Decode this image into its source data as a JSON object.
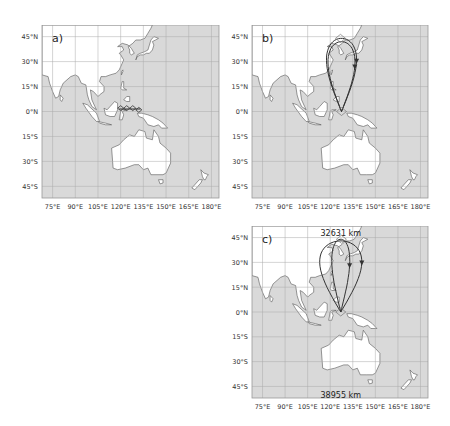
{
  "figure": {
    "panels": [
      {
        "id": "a",
        "label": "a)",
        "left": 42,
        "top": 25,
        "width": 177,
        "height": 173,
        "track": "none",
        "annotations": []
      },
      {
        "id": "b",
        "label": "b)",
        "left": 252,
        "top": 25,
        "width": 176,
        "height": 173,
        "track": "figure-eight",
        "annotations": []
      },
      {
        "id": "c",
        "label": "c)",
        "left": 252,
        "top": 226,
        "width": 176,
        "height": 172,
        "track": "figure-eight-variant",
        "annotations": [
          {
            "text": "32631 km",
            "lon": 127,
            "lat": 48
          },
          {
            "text": "38955 km",
            "lon": 127,
            "lat": -50
          }
        ]
      }
    ],
    "x_ticks": [
      "75°E",
      "90°E",
      "105°E",
      "120°E",
      "135°E",
      "150°E",
      "165°E",
      "180°E"
    ],
    "x_tick_lons": [
      75,
      90,
      105,
      120,
      135,
      150,
      165,
      180
    ],
    "y_ticks": [
      "45°N",
      "30°N",
      "15°N",
      "0°N",
      "15°S",
      "30°S",
      "45°S"
    ],
    "y_tick_lats": [
      45,
      30,
      15,
      0,
      -15,
      -30,
      -45
    ],
    "extent": {
      "lon_min": 68,
      "lon_max": 185,
      "lat_min": -52,
      "lat_max": 52
    },
    "colors": {
      "ocean": "#d9d9d9",
      "land": "#ffffff",
      "grid": "#aaaaaa",
      "coast": "#555555",
      "track": "#333333"
    }
  }
}
